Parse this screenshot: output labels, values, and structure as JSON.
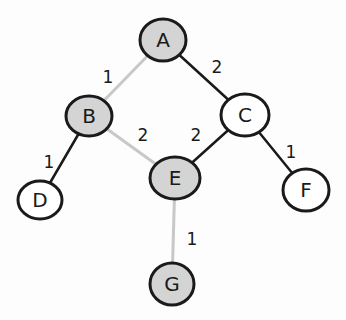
{
  "graph": {
    "colors": {
      "tree_edge": "#c8c8c8",
      "other_edge": "#1a1a1a",
      "visited_fill": "#d4d4d4",
      "unvisited_fill": "#ffffff",
      "outline": "#1a1a1a"
    },
    "nodes": [
      {
        "id": "A",
        "label": "A",
        "x": 163,
        "y": 40,
        "rx": 23,
        "ry": 21,
        "filled": true
      },
      {
        "id": "B",
        "label": "B",
        "x": 89,
        "y": 116,
        "rx": 23,
        "ry": 20,
        "filled": true
      },
      {
        "id": "C",
        "label": "C",
        "x": 245,
        "y": 115,
        "rx": 24,
        "ry": 21,
        "filled": false
      },
      {
        "id": "D",
        "label": "D",
        "x": 40,
        "y": 200,
        "rx": 22,
        "ry": 19,
        "filled": false
      },
      {
        "id": "E",
        "label": "E",
        "x": 175,
        "y": 178,
        "rx": 25,
        "ry": 21,
        "filled": true
      },
      {
        "id": "F",
        "label": "F",
        "x": 306,
        "y": 190,
        "rx": 23,
        "ry": 21,
        "filled": false
      },
      {
        "id": "G",
        "label": "G",
        "x": 172,
        "y": 284,
        "rx": 22,
        "ry": 21,
        "filled": true
      }
    ],
    "edges": [
      {
        "from": "A",
        "to": "B",
        "weight": "1",
        "tree": true,
        "lx": 108,
        "ly": 78
      },
      {
        "from": "A",
        "to": "C",
        "weight": "2",
        "tree": false,
        "lx": 217,
        "ly": 68
      },
      {
        "from": "B",
        "to": "E",
        "weight": "2",
        "tree": true,
        "lx": 143,
        "ly": 136
      },
      {
        "from": "C",
        "to": "E",
        "weight": "2",
        "tree": false,
        "lx": 196,
        "ly": 136
      },
      {
        "from": "B",
        "to": "D",
        "weight": "1",
        "tree": false,
        "lx": 49,
        "ly": 163
      },
      {
        "from": "C",
        "to": "F",
        "weight": "1",
        "tree": false,
        "lx": 291,
        "ly": 153
      },
      {
        "from": "E",
        "to": "G",
        "weight": "1",
        "tree": true,
        "lx": 192,
        "ly": 240
      }
    ]
  }
}
